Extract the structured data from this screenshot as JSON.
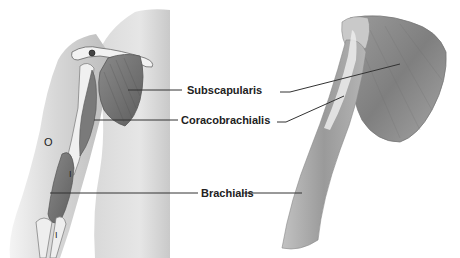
{
  "figure": {
    "left_view": "anterior view of shoulder and arm on torso",
    "right_view": "isolated scapula and humerus with muscles"
  },
  "labels": [
    {
      "id": "subscapularis",
      "text": "Subscapularis"
    },
    {
      "id": "coracobrachialis",
      "text": "Coracobrachialis"
    },
    {
      "id": "brachialis",
      "text": "Brachialis"
    }
  ],
  "markers": {
    "origin": "O",
    "insertion_upper": "I",
    "insertion_lower": "I"
  },
  "colors": {
    "background": "#ffffff",
    "skin_light": "#e6e6e6",
    "skin_mid": "#cfcfcf",
    "muscle_dark": "#6f6f6f",
    "muscle_mid": "#8f8f8f",
    "bone": "#f2f2f2",
    "leader_line": "#333333",
    "text": "#222222"
  }
}
